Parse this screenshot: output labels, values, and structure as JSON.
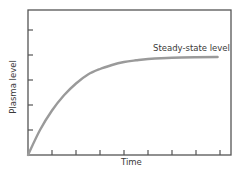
{
  "chart_data": {
    "type": "line",
    "title": "",
    "xlabel": "Time",
    "ylabel": "Plasma level",
    "x_ticks": 8,
    "y_ticks": 5,
    "xlim": [
      0,
      8.5
    ],
    "ylim": [
      0,
      5.8
    ],
    "grid": false,
    "legend": null,
    "annotations": [
      {
        "text": "Steady-state level",
        "x": 5.3,
        "y": 4.1
      }
    ],
    "series": [
      {
        "name": "Plasma level",
        "x": [
          0,
          0.5,
          1,
          1.5,
          2,
          2.5,
          3,
          3.5,
          4,
          4.5,
          5,
          6,
          7,
          7.9
        ],
        "values": [
          0,
          1.0,
          1.78,
          2.39,
          2.86,
          3.22,
          3.44,
          3.6,
          3.72,
          3.79,
          3.84,
          3.89,
          3.91,
          3.92
        ],
        "color": "#9a9a9a"
      }
    ]
  },
  "axes": {
    "x_label": "Time",
    "y_label": "Plasma level"
  },
  "annotation": {
    "steady_state_label": "Steady-state level"
  },
  "colors": {
    "frame": "#555555",
    "curve": "#9a9a9a",
    "text": "#3a3a3a"
  }
}
